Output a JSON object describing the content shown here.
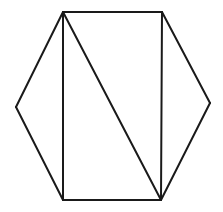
{
  "diagram": {
    "title": "",
    "stroke_color": "#1a1a1a",
    "background_color": "#ffffff",
    "vertices": {
      "top_left": "A",
      "top_right": "B",
      "right": "C",
      "bottom_right": "D",
      "bottom_left": "E",
      "left": "F"
    },
    "edges": [
      {
        "id": "hex-top",
        "from": "top_left",
        "to": "top_right"
      },
      {
        "id": "hex-upper-right",
        "from": "top_right",
        "to": "right"
      },
      {
        "id": "hex-lower-right",
        "from": "right",
        "to": "bottom_right"
      },
      {
        "id": "hex-bottom",
        "from": "bottom_right",
        "to": "bottom_left"
      },
      {
        "id": "hex-lower-left",
        "from": "bottom_left",
        "to": "left"
      },
      {
        "id": "hex-upper-left",
        "from": "left",
        "to": "top_left"
      },
      {
        "id": "rect-left",
        "from": "top_left",
        "to": "bottom_left"
      },
      {
        "id": "rect-right",
        "from": "top_right",
        "to": "bottom_right"
      },
      {
        "id": "diagonal",
        "from": "top_left",
        "to": "bottom_right"
      }
    ]
  }
}
